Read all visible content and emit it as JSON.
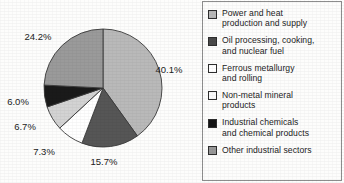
{
  "chart_data": {
    "type": "pie",
    "title": "",
    "subtitle": "",
    "xlabel": "",
    "ylabel": "",
    "legend_position": "right",
    "grid": false,
    "start_angle_deg": 0,
    "direction": "clockwise",
    "units": "percent",
    "total": 100.0,
    "categories": [
      "Power and heat production and supply",
      "Oil processing, cooking, and nuclear fuel",
      "Ferrous metallurgy and rolling",
      "Non-metal mineral products",
      "Industrial chemicals and chemical products",
      "Other industrial sectors"
    ],
    "values": [
      40.1,
      15.7,
      7.3,
      6.7,
      6.0,
      24.2
    ],
    "data_labels": [
      "40.1%",
      "15.7%",
      "7.3%",
      "6.7%",
      "6.0%",
      "24.2%"
    ],
    "slice_colors": [
      "#b9b9b9",
      "#565656",
      "#ffffff",
      "#d3d3d3",
      "#1a1a1a",
      "#9a9a9a"
    ]
  },
  "pie": {
    "center_x": 103,
    "center_y": 88,
    "radius": 59,
    "outline_color": "#3a3a3a",
    "slices": [
      {
        "name": "power-and-heat",
        "label": "40.1%",
        "value": 40.1,
        "color": "#b9b9b9",
        "label_x": 169,
        "label_y": 73
      },
      {
        "name": "oil-processing",
        "label": "15.7%",
        "value": 15.7,
        "color": "#565656",
        "label_x": 104,
        "label_y": 165
      },
      {
        "name": "ferrous-metallurgy",
        "label": "7.3%",
        "value": 7.3,
        "color": "#ffffff",
        "label_x": 44,
        "label_y": 155
      },
      {
        "name": "non-metal-mineral",
        "label": "6.7%",
        "value": 6.7,
        "color": "#d3d3d3",
        "label_x": 25,
        "label_y": 130
      },
      {
        "name": "industrial-chemicals",
        "label": "6.0%",
        "value": 6.0,
        "color": "#1a1a1a",
        "label_x": 18,
        "label_y": 105
      },
      {
        "name": "other-industrial",
        "label": "24.2%",
        "value": 24.2,
        "color": "#9a9a9a",
        "label_x": 38,
        "label_y": 40
      }
    ]
  },
  "legend": {
    "items": [
      {
        "name": "power-and-heat",
        "label": "Power and heat\nproduction and supply",
        "color": "#b9b9b9"
      },
      {
        "name": "oil-processing",
        "label": "Oil processing, cooking,\nand nuclear fuel",
        "color": "#4a4a4a"
      },
      {
        "name": "ferrous-metallurgy",
        "label": "Ferrous metallurgy\nand rolling",
        "color": "#ffffff"
      },
      {
        "name": "non-metal-mineral",
        "label": "Non-metal mineral\nproducts",
        "color": "#fbfbfb"
      },
      {
        "name": "industrial-chemicals",
        "label": "Industrial chemicals\nand chemical products",
        "color": "#141414"
      },
      {
        "name": "other-industrial",
        "label": "Other industrial sectors",
        "color": "#989898"
      }
    ]
  }
}
